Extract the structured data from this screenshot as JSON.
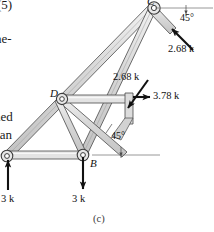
{
  "figure": {
    "caption": "(c)",
    "type": "truss-free-body-diagram"
  },
  "margin_text": {
    "top_fragment": "(5)",
    "line2_fragment": "ne-",
    "line3_fragment": "ned",
    "line4_fragment": "can"
  },
  "joints": [
    {
      "id": "C",
      "label": "C",
      "x": 154,
      "y": 7
    },
    {
      "id": "D",
      "label": "D",
      "x": 63,
      "y": 99
    },
    {
      "id": "B",
      "label": "B",
      "x": 83,
      "y": 155
    },
    {
      "id": "A",
      "label": "",
      "x": 8,
      "y": 156
    }
  ],
  "forces": [
    {
      "name": "force-at-C",
      "label": "2.68 k",
      "magnitude": 2.68,
      "unit": "k",
      "direction": "45-deg-up-right",
      "label_x": 168,
      "label_y": 44
    },
    {
      "name": "force-at-joint-2_68",
      "label": "2.68 k",
      "magnitude": 2.68,
      "unit": "k",
      "direction": "45-deg-down-left",
      "label_x": 114,
      "label_y": 76
    },
    {
      "name": "force-horizontal-3_78",
      "label": "3.78 k",
      "magnitude": 3.78,
      "unit": "k",
      "direction": "right",
      "label_x": 153,
      "label_y": 98
    },
    {
      "name": "reaction-at-A",
      "label": "3 k",
      "magnitude": 3,
      "unit": "k",
      "direction": "up",
      "label_x": 2,
      "label_y": 196
    },
    {
      "name": "load-at-B",
      "label": "3 k",
      "magnitude": 3,
      "unit": "k",
      "direction": "down",
      "label_x": 73,
      "label_y": 196
    }
  ],
  "angles": [
    {
      "name": "angle-top-right",
      "label": "45°",
      "value": 45,
      "unit": "deg",
      "label_x": 181,
      "label_y": 17
    },
    {
      "name": "angle-lower-right",
      "label": "45°",
      "value": 45,
      "unit": "deg",
      "label_x": 113,
      "label_y": 135
    }
  ],
  "colors": {
    "member_fill": "#dcdcdc",
    "member_fill_light": "#eaeaea",
    "member_stroke": "#4a4a4a",
    "arrow": "#111111",
    "reference_line": "#8a8a8a",
    "text": "#111111"
  }
}
